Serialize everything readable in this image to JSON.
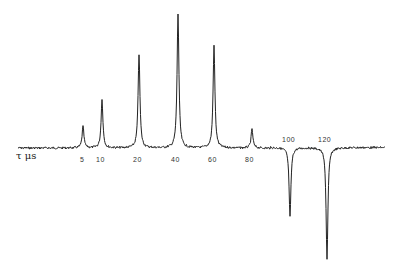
{
  "chart_data": {
    "type": "line",
    "title": "",
    "xlabel": "τ μs",
    "ylabel": "",
    "grid": false,
    "legend": null,
    "peaks": [
      {
        "label": "5",
        "x_px": 83,
        "amplitude": 0.16
      },
      {
        "label": "10",
        "x_px": 102,
        "amplitude": 0.36
      },
      {
        "label": "20",
        "x_px": 139,
        "amplitude": 0.7
      },
      {
        "label": "40",
        "x_px": 178,
        "amplitude": 1.0
      },
      {
        "label": "60",
        "x_px": 214,
        "amplitude": 0.76
      },
      {
        "label": "80",
        "x_px": 252,
        "amplitude": 0.14
      },
      {
        "label": "100",
        "x_px": 290,
        "amplitude": -0.52
      },
      {
        "label": "120",
        "x_px": 327,
        "amplitude": -0.83
      }
    ],
    "tick_labels": [
      "5",
      "10",
      "20",
      "40",
      "60",
      "80",
      "100",
      "120"
    ]
  },
  "labels": {
    "axis": "τ μs",
    "ticks": [
      {
        "text": "5",
        "x": 80,
        "y": 156
      },
      {
        "text": "10",
        "x": 96,
        "y": 156
      },
      {
        "text": "20",
        "x": 133,
        "y": 156
      },
      {
        "text": "40",
        "x": 171,
        "y": 156
      },
      {
        "text": "60",
        "x": 208,
        "y": 156
      },
      {
        "text": "80",
        "x": 245,
        "y": 156
      },
      {
        "text": "100",
        "x": 282,
        "y": 136
      },
      {
        "text": "120",
        "x": 318,
        "y": 136
      }
    ]
  }
}
